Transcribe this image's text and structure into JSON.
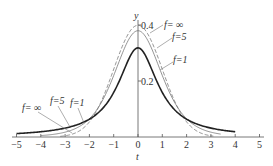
{
  "chart_data": {
    "type": "line",
    "title": "",
    "xlabel": "t",
    "ylabel": "y",
    "xlim": [
      -5.2,
      5.2
    ],
    "ylim": [
      0,
      0.42
    ],
    "x_ticks": [
      -5,
      -4,
      -3,
      -2,
      -1,
      0,
      1,
      2,
      3,
      4,
      5
    ],
    "x_tick_labels": [
      "−5",
      "−4",
      "−3",
      "−2",
      "−1",
      "0",
      "1",
      "2",
      "3",
      "4",
      "5"
    ],
    "y_ticks": [
      0.2,
      0.4
    ],
    "y_tick_labels": [
      "0.2",
      "0.4"
    ],
    "grid": false,
    "legend": "inline labels with leader lines",
    "series": [
      {
        "name": "f=∞",
        "style": "dashed",
        "x_range": [
          -3.2,
          3.1
        ],
        "peak": 0.399,
        "x": [
          -3,
          -2,
          -1,
          0,
          1,
          2,
          3
        ],
        "values": [
          0.004,
          0.054,
          0.242,
          0.399,
          0.242,
          0.054,
          0.004
        ]
      },
      {
        "name": "f=5",
        "style": "thin solid",
        "x_range": [
          -4,
          3.4
        ],
        "peak": 0.38,
        "x": [
          -4,
          -3,
          -2,
          -1,
          0,
          1,
          2,
          3
        ],
        "values": [
          0.005,
          0.017,
          0.065,
          0.22,
          0.38,
          0.22,
          0.065,
          0.017
        ]
      },
      {
        "name": "f=1",
        "style": "thick solid",
        "x_range": [
          -5,
          4
        ],
        "peak": 0.318,
        "x": [
          -5,
          -4,
          -3,
          -2,
          -1,
          0,
          1,
          2,
          3,
          4
        ],
        "values": [
          0.012,
          0.019,
          0.032,
          0.064,
          0.159,
          0.318,
          0.159,
          0.064,
          0.032,
          0.019
        ]
      }
    ],
    "annotations": [
      "f=∞",
      "f=5",
      "f=1",
      "f=∞",
      "f=5",
      "f=1"
    ]
  },
  "labels": {
    "x_axis_title": "t",
    "y_axis_title": "y",
    "right_inf": "f= ∞",
    "right_5": "f=5",
    "right_1": "f=1",
    "left_inf": "f= ∞",
    "left_5": "f=5",
    "left_1": "f=1"
  }
}
